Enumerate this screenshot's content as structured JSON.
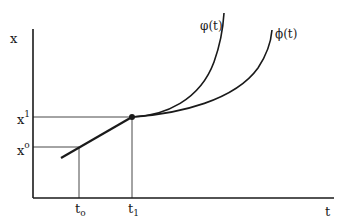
{
  "diagram": {
    "axes": {
      "y_label": "x",
      "x_label": "t"
    },
    "y_ticks": [
      {
        "base": "x",
        "sup": "1",
        "label": "x¹"
      },
      {
        "base": "x",
        "sup": "o",
        "label": "xᵒ"
      }
    ],
    "x_ticks": [
      {
        "base": "t",
        "sub": "o",
        "label": "tₒ"
      },
      {
        "base": "t",
        "sub": "1",
        "label": "t₁"
      }
    ],
    "curves": [
      {
        "name": "varphi",
        "label": "φ(t)"
      },
      {
        "name": "phi",
        "label": "ϕ(t)"
      }
    ],
    "tangent_point": {
      "t": "t₁",
      "x": "x¹"
    },
    "colors": {
      "line": "#1a1a1a",
      "background": "#ffffff"
    }
  }
}
